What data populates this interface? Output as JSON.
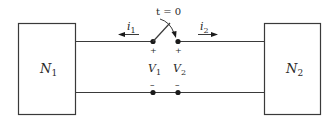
{
  "diagram": {
    "type": "circuit",
    "networks": [
      {
        "id": "N1",
        "label": "N",
        "subscript": "1"
      },
      {
        "id": "N2",
        "label": "N",
        "subscript": "2"
      }
    ],
    "switch": {
      "label": "t = 0"
    },
    "currents": [
      {
        "label": "i",
        "subscript": "1",
        "direction": "left"
      },
      {
        "label": "i",
        "subscript": "2",
        "direction": "right"
      }
    ],
    "voltages": [
      {
        "label": "V",
        "subscript": "1",
        "plus": "+",
        "minus": "–"
      },
      {
        "label": "V",
        "subscript": "2",
        "plus": "+",
        "minus": "–"
      }
    ],
    "colors": {
      "line": "#3a3a3a",
      "background": "#ffffff"
    }
  }
}
